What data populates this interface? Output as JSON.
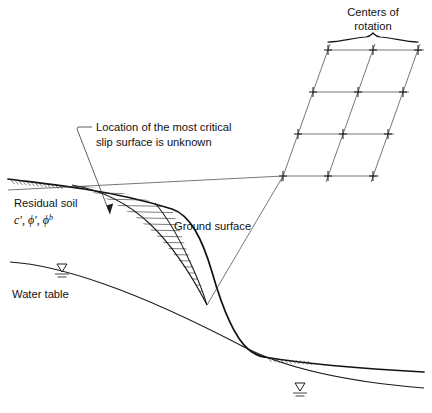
{
  "figure": {
    "title_caption": "",
    "background_color": "#ffffff",
    "line_color": "#1a1a1a",
    "width": 432,
    "height": 413
  },
  "annotations": {
    "centers_of_rotation": {
      "line1": "Centers of",
      "line2": "rotation"
    },
    "critical_slip": {
      "line1": "Location of the most critical",
      "line2": "slip surface is unknown"
    },
    "residual_soil": {
      "line1": "Residual soil",
      "cohesion": "c'",
      "friction_angle": "ϕ'",
      "suction_angle_base": "ϕ",
      "suction_angle_sup": "b",
      "separator": ", ",
      "line2_full": "c', ϕ', ϕb"
    },
    "ground_surface": {
      "label": "Ground surface"
    },
    "water_table": {
      "label": "Water table"
    }
  },
  "grid": {
    "name": "centers-of-rotation-grid",
    "rows": 4,
    "columns": 3,
    "marker_glyph": "+",
    "marker_count": 12,
    "points": [
      {
        "x": 328,
        "y": 50
      },
      {
        "x": 373,
        "y": 50
      },
      {
        "x": 418,
        "y": 50
      },
      {
        "x": 317,
        "y": 92
      },
      {
        "x": 362,
        "y": 92
      },
      {
        "x": 407,
        "y": 92
      },
      {
        "x": 300,
        "y": 135
      },
      {
        "x": 345,
        "y": 135
      },
      {
        "x": 390,
        "y": 135
      },
      {
        "x": 283,
        "y": 177
      },
      {
        "x": 328,
        "y": 177
      },
      {
        "x": 373,
        "y": 177
      }
    ]
  },
  "brace": {
    "name": "centers-of-rotation-brace",
    "x_start": 328,
    "x_end": 418,
    "y": 40,
    "peak_x": 373
  },
  "geometry": {
    "ground_surface_path": "M 8,179 C 60,188 120,196 172,209 C 196,216 212,247 224,290 C 233,322 240,345 262,356",
    "ground_surface_lower_right": "M 262,356 C 300,364 350,369 420,373",
    "water_table_path": "M 10,262 C 60,268 110,282 160,300 C 210,318 260,340 300,358 C 340,376 390,386 424,390",
    "slip_surface_outer": "M 72,185 C 110,196 150,222 180,262 C 196,283 202,296 207,305",
    "slip_surface_inner": "M 155,203 C 168,216 180,238 192,262 C 200,279 204,294 207,305",
    "toe_point": {
      "x": 207,
      "y": 305
    },
    "crest_point": {
      "x": 72,
      "y": 185
    }
  },
  "leaders": {
    "critical_slip_leader": "M 88,128 L 80,128 L 78,130 L 112,218",
    "critical_slip_arrow_tip": {
      "x": 112,
      "y": 218
    },
    "grid_to_slope_line": "M 207,305 L 283,177",
    "grid_to_crest_line": "M 8,192 L 283,177"
  },
  "text_positions": {
    "centers_of_rotation": {
      "x": 373,
      "y": 14
    },
    "critical_slip": {
      "x": 94,
      "y": 129
    },
    "residual_soil": {
      "x": 14,
      "y": 205
    },
    "residual_soil_params": {
      "x": 14,
      "y": 222
    },
    "ground_surface": {
      "x": 174,
      "y": 228
    },
    "water_table": {
      "x": 12,
      "y": 296
    }
  },
  "symbols": {
    "ground_hatch_left": {
      "x": 12,
      "y": 180,
      "count": 13
    },
    "ground_hatch_right": {
      "x": 292,
      "y": 359,
      "count": 13
    },
    "water_table_triangle_upper": {
      "x": 62,
      "y": 266
    },
    "water_table_triangle_lower": {
      "x": 300,
      "y": 389
    }
  }
}
